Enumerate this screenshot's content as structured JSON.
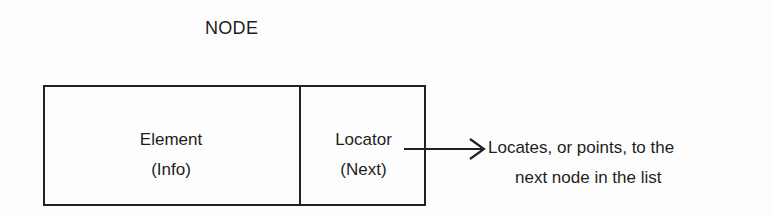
{
  "title": "NODE",
  "node": {
    "element": {
      "line1": "Element",
      "line2": "(Info)"
    },
    "locator": {
      "line1": "Locator",
      "line2": "(Next)"
    }
  },
  "annotation": {
    "line1": "Locates, or points, to the",
    "line2": "next node in the list"
  },
  "colors": {
    "stroke": "#222222",
    "text": "#1e1e1e",
    "background": "#fdfdfd"
  }
}
